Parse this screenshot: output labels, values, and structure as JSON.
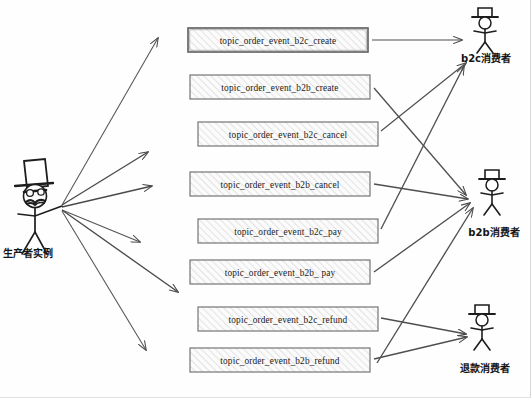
{
  "diagram": {
    "type": "message-broker-topic-routing",
    "producer": {
      "label": "生产者实例",
      "icon": "stick-figure-with-tophat-glasses-mustache-icon",
      "x": 40,
      "y": 205
    },
    "topics": [
      {
        "id": "b2c_create",
        "label": "topic_order_event_b2c_create",
        "x": 188,
        "y": 28,
        "w": 180,
        "h": 24
      },
      {
        "id": "b2b_create",
        "label": "topic_order_event_b2b_create",
        "x": 190,
        "y": 75,
        "w": 180,
        "h": 24
      },
      {
        "id": "b2c_cancel",
        "label": "topic_order_event_b2c_cancel",
        "x": 198,
        "y": 122,
        "w": 180,
        "h": 24
      },
      {
        "id": "b2b_cancel",
        "label": "topic_order_event_b2b_cancel",
        "x": 190,
        "y": 172,
        "w": 180,
        "h": 24
      },
      {
        "id": "b2c_pay",
        "label": "topic_order_event_b2c_pay",
        "x": 198,
        "y": 219,
        "w": 180,
        "h": 24
      },
      {
        "id": "b2b_pay",
        "label": "topic_order_event_b2b_ pay",
        "x": 190,
        "y": 260,
        "w": 180,
        "h": 24
      },
      {
        "id": "b2c_refund",
        "label": "topic_order_event_b2c_refund",
        "x": 198,
        "y": 307,
        "w": 180,
        "h": 24
      },
      {
        "id": "b2b_refund",
        "label": "topic_order_event_b2b_refund",
        "x": 190,
        "y": 348,
        "w": 180,
        "h": 24
      }
    ],
    "consumers": [
      {
        "id": "b2c",
        "label": "b2c消费者",
        "icon": "stick-figure-with-hat-icon",
        "x": 484,
        "y": 24,
        "label_x": 488,
        "label_y": 60
      },
      {
        "id": "b2b",
        "label": "b2b消费者",
        "icon": "stick-figure-with-hat-icon",
        "x": 491,
        "y": 184,
        "label_x": 494,
        "label_y": 234
      },
      {
        "id": "refund",
        "label": "退款消费者",
        "icon": "stick-figure-with-hat-icon",
        "x": 481,
        "y": 318,
        "label_x": 484,
        "label_y": 370
      }
    ],
    "producer_arrows": [
      {
        "from": [
          62,
          205
        ],
        "to": [
          158,
          38
        ]
      },
      {
        "from": [
          62,
          205
        ],
        "to": [
          148,
          152
        ]
      },
      {
        "from": [
          62,
          205
        ],
        "to": [
          150,
          185
        ]
      },
      {
        "from": [
          62,
          205
        ],
        "to": [
          140,
          242
        ]
      },
      {
        "from": [
          62,
          205
        ],
        "to": [
          178,
          292
        ]
      },
      {
        "from": [
          62,
          205
        ],
        "to": [
          146,
          350
        ]
      }
    ],
    "topic_arrows": [
      {
        "topic": "b2c_create",
        "consumer": "b2c",
        "from": [
          372,
          40
        ],
        "to": [
          463,
          40
        ]
      },
      {
        "topic": "b2b_create",
        "consumer": "b2b",
        "from": [
          374,
          88
        ],
        "to": [
          466,
          196
        ]
      },
      {
        "topic": "b2c_cancel",
        "consumer": "b2c",
        "from": [
          381,
          130
        ],
        "to": [
          467,
          62
        ]
      },
      {
        "topic": "b2b_cancel",
        "consumer": "b2b",
        "from": [
          374,
          184
        ],
        "to": [
          468,
          200
        ]
      },
      {
        "topic": "b2c_pay",
        "consumer": "b2c",
        "from": [
          381,
          228
        ],
        "to": [
          465,
          66
        ]
      },
      {
        "topic": "b2b_pay",
        "consumer": "b2b",
        "from": [
          374,
          272
        ],
        "to": [
          470,
          204
        ]
      },
      {
        "topic": "b2c_refund",
        "consumer": "refund",
        "from": [
          381,
          318
        ],
        "to": [
          468,
          334
        ]
      },
      {
        "topic": "b2b_refund",
        "consumer": "refund",
        "from": [
          374,
          358
        ],
        "to": [
          469,
          338
        ]
      },
      {
        "topic": "b2b_refund",
        "consumer": "b2b",
        "from": [
          376,
          362
        ],
        "to": [
          474,
          208
        ]
      }
    ]
  },
  "style": {
    "arrow_color": "#4a4a4a",
    "box_stroke": "#6d6d6d",
    "box_fill": "#fafafa",
    "hatch_color": "#c9c9c9",
    "text_color": "#1a1a1a",
    "background": "#fefefe"
  }
}
